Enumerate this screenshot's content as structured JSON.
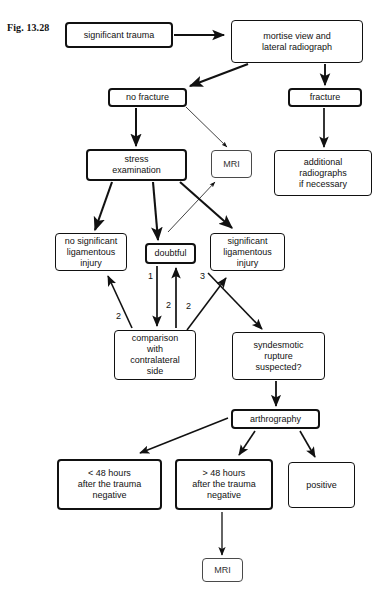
{
  "figure": {
    "label": "Fig. 13.28",
    "page_number": "",
    "width": 379,
    "height": 602
  },
  "diagram": {
    "type": "flowchart",
    "nodes": [
      {
        "id": "significant-trauma",
        "label": "significant trauma",
        "x": 65,
        "y": 22,
        "w": 108,
        "h": 26,
        "weight": "thick"
      },
      {
        "id": "mortise-view",
        "label": "mortise view and\nlateral radiograph",
        "x": 231,
        "y": 20,
        "w": 132,
        "h": 43,
        "weight": "normal"
      },
      {
        "id": "no-fracture",
        "label": "no fracture",
        "x": 108,
        "y": 88,
        "w": 79,
        "h": 19,
        "weight": "thick"
      },
      {
        "id": "fracture",
        "label": "fracture",
        "x": 288,
        "y": 88,
        "w": 74,
        "h": 19,
        "weight": "thick"
      },
      {
        "id": "stress-examination",
        "label": "stress\nexamination",
        "x": 86,
        "y": 149,
        "w": 101,
        "h": 32,
        "weight": "thick"
      },
      {
        "id": "mri-upper",
        "label": "MRI",
        "x": 211,
        "y": 150,
        "w": 41,
        "h": 28,
        "weight": "thin"
      },
      {
        "id": "additional-radiographs",
        "label": "additional\nradiographs\nif necessary",
        "x": 274,
        "y": 150,
        "w": 98,
        "h": 46,
        "weight": "normal"
      },
      {
        "id": "no-significant-injury",
        "label": "no significant\nligamentous\ninjury",
        "x": 55,
        "y": 233,
        "w": 72,
        "h": 38,
        "weight": "normal"
      },
      {
        "id": "doubtful",
        "label": "doubtful",
        "x": 145,
        "y": 243,
        "w": 51,
        "h": 21,
        "weight": "thick"
      },
      {
        "id": "significant-injury",
        "label": "significant\nligamentous\ninjury",
        "x": 210,
        "y": 233,
        "w": 75,
        "h": 38,
        "weight": "normal"
      },
      {
        "id": "comparison",
        "label": "comparison\nwith\ncontralateral\nside",
        "x": 114,
        "y": 330,
        "w": 82,
        "h": 50,
        "weight": "normal"
      },
      {
        "id": "syndesmotic-rupture",
        "label": "syndesmotic\nrupture\nsuspected?",
        "x": 232,
        "y": 332,
        "w": 93,
        "h": 48,
        "weight": "normal"
      },
      {
        "id": "arthrography",
        "label": "arthrography",
        "x": 231,
        "y": 409,
        "w": 89,
        "h": 20,
        "weight": "thick"
      },
      {
        "id": "less-48-hours",
        "label": "< 48 hours\nafter the trauma\nnegative",
        "x": 57,
        "y": 459,
        "w": 105,
        "h": 51,
        "weight": "thick"
      },
      {
        "id": "more-48-hours",
        "label": "> 48 hours\nafter the trauma\nnegative",
        "x": 175,
        "y": 459,
        "w": 98,
        "h": 51,
        "weight": "thick"
      },
      {
        "id": "positive",
        "label": "positive",
        "x": 288,
        "y": 462,
        "w": 67,
        "h": 46,
        "weight": "normal"
      },
      {
        "id": "mri-lower",
        "label": "MRI",
        "x": 202,
        "y": 558,
        "w": 41,
        "h": 24,
        "weight": "thin"
      }
    ],
    "edge_labels": [
      {
        "id": "edge-num-1",
        "text": "1",
        "x": 148,
        "y": 271
      },
      {
        "id": "edge-num-2-center",
        "text": "2",
        "x": 166,
        "y": 300
      },
      {
        "id": "edge-num-2-left",
        "text": "2",
        "x": 116,
        "y": 311
      },
      {
        "id": "edge-num-2-right",
        "text": "2",
        "x": 186,
        "y": 301
      },
      {
        "id": "edge-num-3",
        "text": "3",
        "x": 200,
        "y": 271
      }
    ],
    "edges": [
      {
        "id": "edge-trauma-to-mortise",
        "from": "significant-trauma",
        "to": "mortise-view"
      },
      {
        "id": "edge-mortise-to-no-fracture",
        "from": "mortise-view",
        "to": "no-fracture"
      },
      {
        "id": "edge-mortise-to-fracture",
        "from": "mortise-view",
        "to": "fracture"
      },
      {
        "id": "edge-no-fracture-to-stress",
        "from": "no-fracture",
        "to": "stress-examination"
      },
      {
        "id": "edge-no-fracture-to-mri",
        "from": "no-fracture",
        "to": "mri-upper"
      },
      {
        "id": "edge-fracture-to-additional",
        "from": "fracture",
        "to": "additional-radiographs"
      },
      {
        "id": "edge-stress-to-no-sig",
        "from": "stress-examination",
        "to": "no-significant-injury"
      },
      {
        "id": "edge-stress-to-doubtful",
        "from": "stress-examination",
        "to": "doubtful"
      },
      {
        "id": "edge-stress-to-sig",
        "from": "stress-examination",
        "to": "significant-injury"
      },
      {
        "id": "edge-doubtful-to-mri",
        "from": "doubtful",
        "to": "mri-upper"
      },
      {
        "id": "edge-doubtful-to-comparison",
        "from": "doubtful",
        "to": "comparison"
      },
      {
        "id": "edge-comparison-to-doubtful",
        "from": "comparison",
        "to": "doubtful"
      },
      {
        "id": "edge-comparison-to-no-sig",
        "from": "comparison",
        "to": "no-significant-injury"
      },
      {
        "id": "edge-comparison-to-sig",
        "from": "comparison",
        "to": "significant-injury"
      },
      {
        "id": "edge-sig-to-syndesmotic",
        "from": "significant-injury",
        "to": "syndesmotic-rupture"
      },
      {
        "id": "edge-syndesmotic-to-arthro",
        "from": "syndesmotic-rupture",
        "to": "arthrography"
      },
      {
        "id": "edge-arthro-to-less48",
        "from": "arthrography",
        "to": "less-48-hours"
      },
      {
        "id": "edge-arthro-to-more48",
        "from": "arthrography",
        "to": "more-48-hours"
      },
      {
        "id": "edge-arthro-to-positive",
        "from": "arthrography",
        "to": "positive"
      },
      {
        "id": "edge-more48-to-mri",
        "from": "more-48-hours",
        "to": "mri-lower"
      }
    ]
  },
  "colors": {
    "ink": "#111111",
    "thin_ink": "#4a4a4a",
    "background": "#ffffff"
  }
}
